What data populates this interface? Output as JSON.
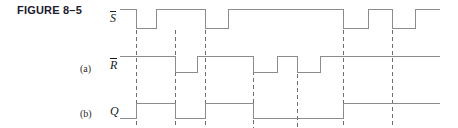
{
  "figure": {
    "title": "FIGURE 8–5",
    "width": 458,
    "height": 128,
    "background": "#ffffff",
    "wave_color": "#8c8c8c",
    "marker_color": "#6f6f6f",
    "title_color": "#1b1b2e"
  },
  "rows": [
    {
      "tag": "",
      "label_text": "S",
      "overbar": true,
      "name": "s-not"
    },
    {
      "tag": "(a)",
      "label_text": "R",
      "overbar": true,
      "name": "r-not"
    },
    {
      "tag": "(b)",
      "label_text": "Q",
      "overbar": false,
      "name": "q"
    }
  ],
  "chart_data": {
    "type": "line",
    "title": "FIGURE 8–5",
    "subtitle": "",
    "xlabel": "",
    "ylabel": "",
    "grid": false,
    "legend_position": "left-labels",
    "x_range": [
      120,
      440
    ],
    "signals": [
      {
        "name": "S-bar",
        "label": "S",
        "overbar": true,
        "row": "top",
        "high_y": 9,
        "low_y": 28,
        "start_level": "high",
        "transitions": [
          {
            "x": 136,
            "to": "low"
          },
          {
            "x": 156,
            "to": "high"
          },
          {
            "x": 205,
            "to": "low"
          },
          {
            "x": 228,
            "to": "high"
          },
          {
            "x": 343,
            "to": "low"
          },
          {
            "x": 368,
            "to": "high"
          },
          {
            "x": 392,
            "to": "low"
          },
          {
            "x": 415,
            "to": "high"
          }
        ]
      },
      {
        "name": "R-bar",
        "label": "R",
        "overbar": true,
        "row": "middle",
        "high_y": 56,
        "low_y": 72,
        "start_level": "high",
        "transitions": [
          {
            "x": 175,
            "to": "low"
          },
          {
            "x": 197,
            "to": "high"
          },
          {
            "x": 253,
            "to": "low"
          },
          {
            "x": 277,
            "to": "high"
          },
          {
            "x": 297,
            "to": "low"
          },
          {
            "x": 320,
            "to": "high"
          }
        ]
      },
      {
        "name": "Q",
        "label": "Q",
        "overbar": false,
        "row": "bottom",
        "high_y": 103,
        "low_y": 118,
        "start_level": "low",
        "transitions": [
          {
            "x": 136,
            "to": "high"
          },
          {
            "x": 175,
            "to": "low"
          },
          {
            "x": 205,
            "to": "high"
          },
          {
            "x": 253,
            "to": "low"
          },
          {
            "x": 343,
            "to": "high"
          }
        ]
      }
    ],
    "markers": [
      {
        "x": 136,
        "y1": 9,
        "y2": 128
      },
      {
        "x": 175,
        "y1": 30,
        "y2": 128
      },
      {
        "x": 205,
        "y1": 9,
        "y2": 128
      },
      {
        "x": 253,
        "y1": 57,
        "y2": 128
      },
      {
        "x": 297,
        "y1": 74,
        "y2": 128
      },
      {
        "x": 343,
        "y1": 9,
        "y2": 128
      },
      {
        "x": 392,
        "y1": 9,
        "y2": 128
      }
    ]
  }
}
